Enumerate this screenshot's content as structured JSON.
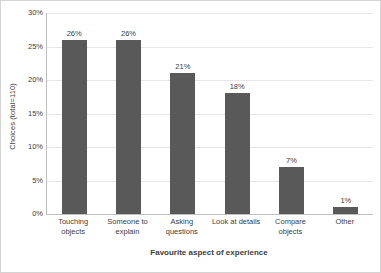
{
  "chart_data": {
    "type": "bar",
    "title": "",
    "subtitle": "",
    "xlabel": "Favourite aspect of experience",
    "ylabel": "Choices (total=110)",
    "categories": [
      "Touching objects",
      "Someone to explain",
      "Asking questions",
      "Look at details",
      "Compare objects",
      "Other"
    ],
    "values": [
      26,
      26,
      21,
      18,
      7,
      1
    ],
    "data_labels": [
      "26%",
      "26%",
      "21%",
      "18%",
      "7%",
      "1%"
    ],
    "ylim": [
      0,
      30
    ],
    "ytick_values": [
      0,
      5,
      10,
      15,
      20,
      25,
      30
    ],
    "ytick_labels": [
      "0%",
      "5%",
      "10%",
      "15%",
      "20%",
      "25%",
      "30%"
    ],
    "grid": true,
    "grid_axis": "y",
    "legend": false,
    "legend_position": "none",
    "bar_color": "#595959",
    "gridline_color": "#E6E6E6",
    "axis_color": "#BFBFBF",
    "text_color": "#404040",
    "background_color": "#FFFFFF",
    "units": "percent"
  }
}
